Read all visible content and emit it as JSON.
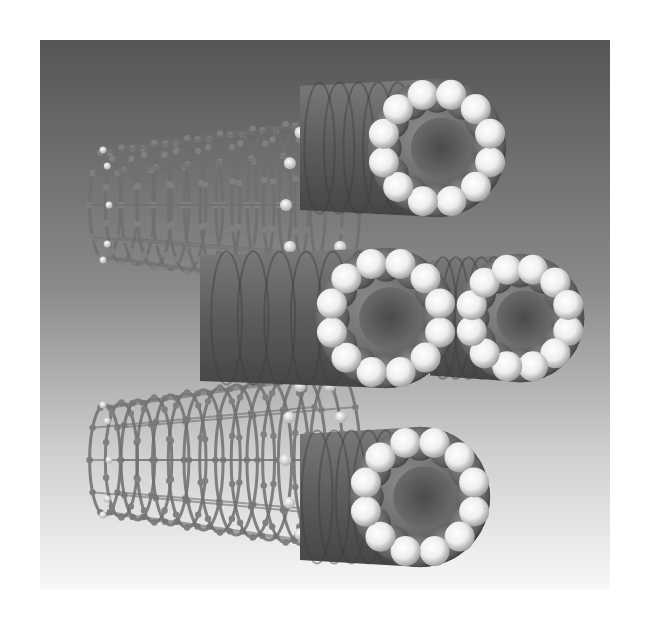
{
  "image": {
    "subject": "Carbon nanotube bundle rendering",
    "description": "Grayscale 3D molecular rendering: two ball-and-stick nanotubes on the left and four space-filling hydrogen-capped nanotube ends on the right",
    "palette": {
      "page_background": "#ffffff",
      "backdrop_top": "#555555",
      "backdrop_bottom": "#f8f8f8",
      "tube_body": "#6e6e6e",
      "tube_shadow": "#3e3e3e",
      "hydrogen": "#f4f4f4",
      "bond": "#7a7a7a"
    },
    "backdrop": {
      "x": 40,
      "y": 40,
      "width": 570,
      "height": 550
    },
    "space_filling_tubes": [
      {
        "name": "top-ring",
        "cx": 437,
        "cy": 148,
        "r": 55,
        "atoms": 12,
        "tail_to_x": 300
      },
      {
        "name": "middle-left-ring",
        "cx": 386,
        "cy": 318,
        "r": 56,
        "atoms": 12,
        "tail_to_x": 200
      },
      {
        "name": "middle-right-ring",
        "cx": 520,
        "cy": 318,
        "r": 50,
        "atoms": 12,
        "tail_to_x": 430
      },
      {
        "name": "bottom-ring",
        "cx": 420,
        "cy": 497,
        "r": 56,
        "atoms": 12,
        "tail_to_x": 300
      }
    ],
    "ball_and_stick_tubes": [
      {
        "name": "upper-stick-tube",
        "x1": 105,
        "x2": 335,
        "cy": 205,
        "ry_left": 55,
        "ry_right": 88
      },
      {
        "name": "lower-stick-tube",
        "x1": 105,
        "x2": 335,
        "cy": 460,
        "ry_left": 55,
        "ry_right": 90
      }
    ]
  }
}
